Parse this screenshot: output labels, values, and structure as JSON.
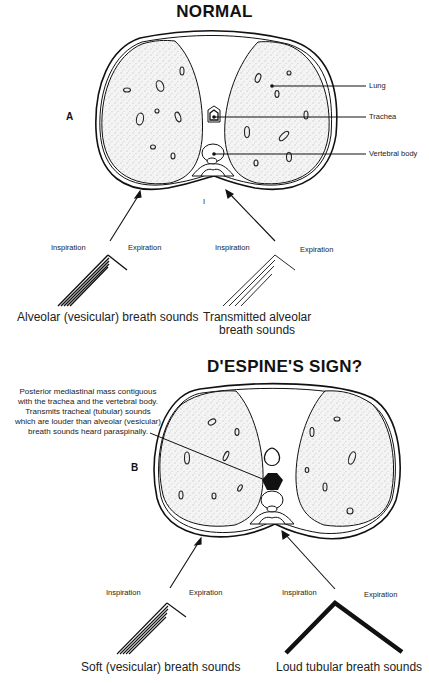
{
  "figure_a": {
    "title": "NORMAL",
    "panel_label": "A",
    "callouts": {
      "lung": "Lung",
      "trachea": "Trachea",
      "vertebral_body": "Vertebral body"
    },
    "midline_mark": "I",
    "left_graph": {
      "inspiration": "Inspiration",
      "expiration": "Expiration",
      "caption": "Alveolar (vesicular) breath sounds"
    },
    "right_graph": {
      "inspiration": "Inspiration",
      "expiration": "Expiration",
      "caption_line1": "Transmitted alveolar",
      "caption_line2": "breath sounds"
    }
  },
  "figure_b": {
    "title": "D'ESPINE'S SIGN?",
    "panel_label": "B",
    "note_lines": [
      "Posterior mediastinal mass contiguous",
      "with the trachea and the vertebral body.",
      "Transmits tracheal (tubular) sounds",
      "which are louder than alveolar (vesicular)",
      "breath sounds heard paraspinally."
    ],
    "left_graph": {
      "inspiration": "Inspiration",
      "expiration": "Expiration",
      "caption": "Soft (vesicular) breath sounds"
    },
    "right_graph": {
      "inspiration": "Inspiration",
      "expiration": "Expiration",
      "caption": "Loud tubular breath sounds"
    }
  }
}
